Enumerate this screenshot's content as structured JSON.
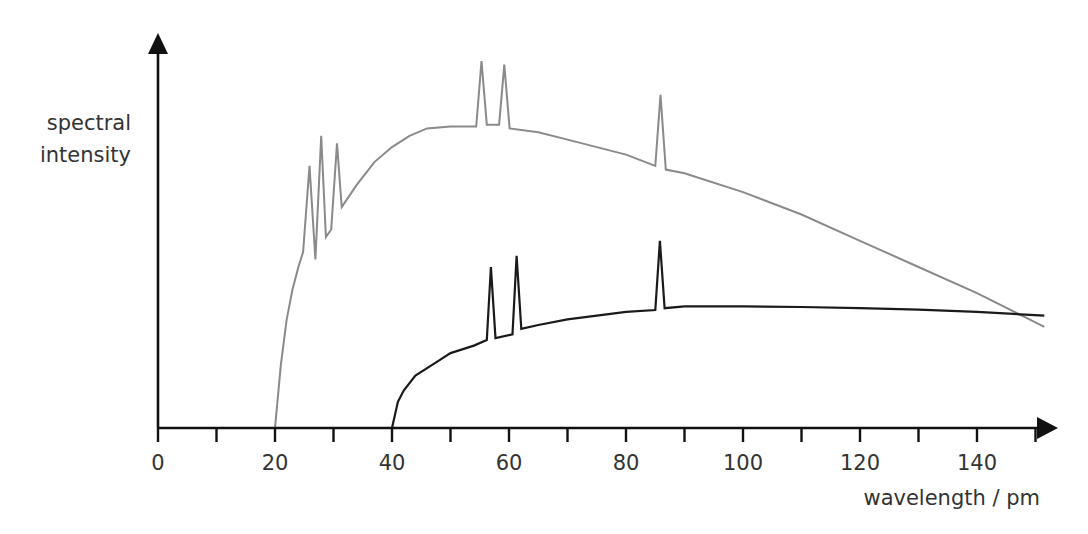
{
  "chart_data": {
    "type": "line",
    "title": "",
    "xlabel": "wavelength / pm",
    "ylabel": "spectral intensity",
    "ylabel_lines": [
      "spectral",
      "intensity"
    ],
    "xlim": [
      0,
      152
    ],
    "ylim": [
      0,
      1
    ],
    "x_ticks_minor_step": 10,
    "x_tick_labels": [
      "0",
      "20",
      "40",
      "60",
      "80",
      "100",
      "120",
      "140"
    ],
    "x_tick_label_values": [
      0,
      20,
      40,
      60,
      80,
      100,
      120,
      140
    ],
    "y_ticks": [],
    "grid": false,
    "legend": null,
    "series": [
      {
        "name": "spectrum (higher tube voltage)",
        "color": "#8a8a8a",
        "stroke_width": 2,
        "points": [
          [
            20,
            0.0
          ],
          [
            21,
            0.17
          ],
          [
            22,
            0.29
          ],
          [
            23,
            0.37
          ],
          [
            24,
            0.43
          ],
          [
            24.8,
            0.47
          ],
          [
            25.9,
            0.7
          ],
          [
            26.9,
            0.45
          ],
          [
            27.9,
            0.78
          ],
          [
            28.7,
            0.51
          ],
          [
            29.6,
            0.53
          ],
          [
            30.6,
            0.76
          ],
          [
            31.4,
            0.59
          ],
          [
            34,
            0.65
          ],
          [
            37,
            0.71
          ],
          [
            40,
            0.75
          ],
          [
            43,
            0.78
          ],
          [
            46,
            0.8
          ],
          [
            50,
            0.805
          ],
          [
            54.4,
            0.805
          ],
          [
            55.3,
            0.98
          ],
          [
            56.2,
            0.81
          ],
          [
            58.3,
            0.81
          ],
          [
            59.2,
            0.97
          ],
          [
            60.1,
            0.8
          ],
          [
            65,
            0.79
          ],
          [
            70,
            0.77
          ],
          [
            75,
            0.75
          ],
          [
            80,
            0.73
          ],
          [
            85,
            0.7
          ],
          [
            85.9,
            0.89
          ],
          [
            86.8,
            0.69
          ],
          [
            90,
            0.68
          ],
          [
            100,
            0.63
          ],
          [
            110,
            0.57
          ],
          [
            120,
            0.5
          ],
          [
            130,
            0.43
          ],
          [
            140,
            0.36
          ],
          [
            151.5,
            0.27
          ]
        ]
      },
      {
        "name": "spectrum (lower tube voltage)",
        "color": "#1a1a1a",
        "stroke_width": 2.2,
        "points": [
          [
            40,
            0.0
          ],
          [
            41,
            0.07
          ],
          [
            42,
            0.1
          ],
          [
            44,
            0.14
          ],
          [
            46,
            0.16
          ],
          [
            48,
            0.18
          ],
          [
            50,
            0.2
          ],
          [
            52,
            0.21
          ],
          [
            54,
            0.22
          ],
          [
            56.2,
            0.235
          ],
          [
            56.9,
            0.43
          ],
          [
            57.7,
            0.24
          ],
          [
            60.6,
            0.25
          ],
          [
            61.3,
            0.46
          ],
          [
            62.1,
            0.265
          ],
          [
            65,
            0.275
          ],
          [
            70,
            0.29
          ],
          [
            75,
            0.3
          ],
          [
            80,
            0.31
          ],
          [
            85,
            0.315
          ],
          [
            85.8,
            0.5
          ],
          [
            86.6,
            0.32
          ],
          [
            90,
            0.325
          ],
          [
            100,
            0.325
          ],
          [
            110,
            0.323
          ],
          [
            120,
            0.32
          ],
          [
            130,
            0.316
          ],
          [
            140,
            0.31
          ],
          [
            151.5,
            0.3
          ]
        ]
      }
    ],
    "annotations": []
  }
}
